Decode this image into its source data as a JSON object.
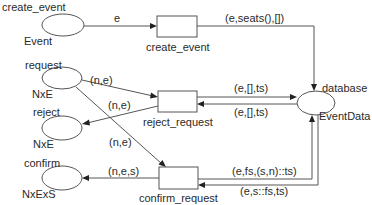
{
  "diagram": {
    "type": "colored-petri-net",
    "places": [
      {
        "id": "create_event",
        "name": "create_event",
        "colorset": "Event",
        "cx": 63,
        "cy": 25,
        "rx": 21,
        "ry": 11
      },
      {
        "id": "request",
        "name": "request",
        "colorset": "NxE",
        "cx": 62,
        "cy": 78,
        "rx": 20,
        "ry": 11
      },
      {
        "id": "reject",
        "name": "reject",
        "colorset": "NxE",
        "cx": 62,
        "cy": 128,
        "rx": 20,
        "ry": 12
      },
      {
        "id": "confirm",
        "name": "confirm",
        "colorset": "NxExS",
        "cx": 62,
        "cy": 178,
        "rx": 20,
        "ry": 12
      },
      {
        "id": "database",
        "name": "database",
        "colorset": "EventData",
        "cx": 315,
        "cy": 103,
        "rx": 19,
        "ry": 12
      }
    ],
    "transitions": [
      {
        "id": "create_event_t",
        "name": "create_event",
        "x": 157,
        "y": 16,
        "w": 40,
        "h": 21
      },
      {
        "id": "reject_request",
        "name": "reject_request",
        "x": 158,
        "y": 91,
        "w": 39,
        "h": 21
      },
      {
        "id": "confirm_request",
        "name": "confirm_request",
        "x": 159,
        "y": 167,
        "w": 39,
        "h": 22
      }
    ],
    "arcs": [
      {
        "from": "create_event",
        "to": "create_event_t",
        "inscription": "e"
      },
      {
        "from": "create_event_t",
        "to": "database",
        "inscription": "(e,seats(),[])"
      },
      {
        "from": "request",
        "to": "reject_request",
        "inscription": "(n,e)"
      },
      {
        "from": "reject_request",
        "to": "reject",
        "inscription": "(n,e)"
      },
      {
        "from": "request",
        "to": "confirm_request",
        "inscription": "(n,e)"
      },
      {
        "from": "confirm_request",
        "to": "confirm",
        "inscription": "(n,e,s)"
      },
      {
        "from": "reject_request",
        "to": "database",
        "inscription": "(e,[],ts)"
      },
      {
        "from": "database",
        "to": "reject_request",
        "inscription": "(e,[],ts)"
      },
      {
        "from": "confirm_request",
        "to": "database",
        "inscription": "(e,fs,(s,n)::ts)"
      },
      {
        "from": "database",
        "to": "confirm_request",
        "inscription": "(e,s::fs,ts)"
      }
    ]
  },
  "labels": {
    "place_create_event": "create_event",
    "place_create_event_type": "Event",
    "place_request": "request",
    "place_request_type": "NxE",
    "place_reject": "reject",
    "place_reject_type": "NxE",
    "place_confirm": "confirm",
    "place_confirm_type": "NxExS",
    "place_database": "database",
    "place_database_type": "EventData",
    "trans_create_event": "create_event",
    "trans_reject_request": "reject_request",
    "trans_confirm_request": "confirm_request",
    "arc_e": "e",
    "arc_create_db": "(e,seats(),[])",
    "arc_req_reject": "(n,e)",
    "arc_reject_out": "(n,e)",
    "arc_req_confirm": "(n,e)",
    "arc_confirm_out": "(n,e,s)",
    "arc_reject_to_db": "(e,[],ts)",
    "arc_db_to_reject": "(e,[],ts)",
    "arc_confirm_to_db": "(e,fs,(s,n)::ts)",
    "arc_db_to_confirm": "(e,s::fs,ts)"
  }
}
